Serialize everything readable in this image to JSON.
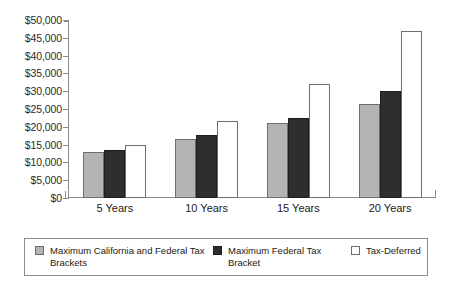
{
  "chart_data": {
    "type": "bar",
    "title": "",
    "xlabel": "",
    "ylabel": "",
    "categories": [
      "5 Years",
      "10 Years",
      "15 Years",
      "20 Years"
    ],
    "ylim": [
      0,
      50000
    ],
    "ytick_labels": [
      "$50,000",
      "$45,000",
      "$40,000",
      "$35,000",
      "$30,000",
      "$25,000",
      "$20,000",
      "$15,000",
      "$10,000",
      "$5,000",
      "$0"
    ],
    "ytick_values": [
      50000,
      45000,
      40000,
      35000,
      30000,
      25000,
      20000,
      15000,
      10000,
      5000,
      0
    ],
    "grid": false,
    "legend_position": "bottom",
    "series": [
      {
        "name": "Maximum California and Federal Tax Brackets",
        "color": "#b4b4b4",
        "values": [
          13000,
          16500,
          21000,
          26500
        ]
      },
      {
        "name": "Maximum Federal Tax Bracket",
        "color": "#2e2e2e",
        "values": [
          13400,
          17700,
          22500,
          30000
        ]
      },
      {
        "name": "Tax-Deferred",
        "color": "#ffffff",
        "values": [
          15000,
          21500,
          32000,
          47000
        ]
      }
    ]
  },
  "legend": {
    "items": [
      {
        "label": "Maximum California and Federal Tax Brackets"
      },
      {
        "label": "Maximum Federal Tax Bracket"
      },
      {
        "label": "Tax-Deferred"
      }
    ]
  }
}
